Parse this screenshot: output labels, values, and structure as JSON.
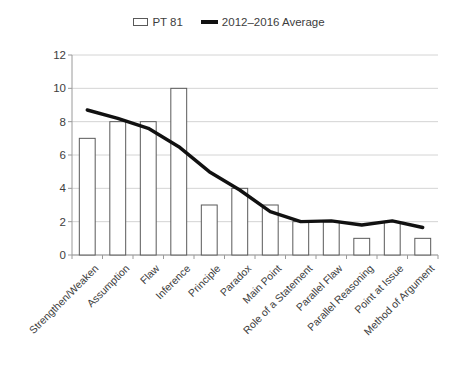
{
  "chart_data": {
    "type": "bar",
    "title": "",
    "xlabel": "",
    "ylabel": "",
    "ylim": [
      0,
      12
    ],
    "ytick_step": 2,
    "yticks": [
      0,
      2,
      4,
      6,
      8,
      10,
      12
    ],
    "grid": true,
    "legend_position": "top-center",
    "categories": [
      "Strengthen/Weaken",
      "Assumption",
      "Flaw",
      "Inference",
      "Principle",
      "Paradox",
      "Main Point",
      "Role of a Statement",
      "Parallel Flaw",
      "Parallel Reasoning",
      "Point at Issue",
      "Method of Argument"
    ],
    "series": [
      {
        "name": "PT 81",
        "type": "bar",
        "color": "#ffffff",
        "edge_color": "#595959",
        "values": [
          7,
          8,
          8,
          10,
          3,
          4,
          3,
          2,
          2,
          1,
          2,
          1
        ]
      },
      {
        "name": "2012–2016 Average",
        "type": "line",
        "color": "#111111",
        "values": [
          8.7,
          8.2,
          7.6,
          6.5,
          5.0,
          3.9,
          2.6,
          2.0,
          2.05,
          1.8,
          2.05,
          1.65
        ]
      }
    ]
  },
  "legend": {
    "entries": [
      {
        "label": "PT 81",
        "icon": "bar-swatch-icon"
      },
      {
        "label": "2012–2016 Average",
        "icon": "line-swatch-icon"
      }
    ]
  },
  "axes": {
    "y_tick_labels": [
      "12",
      "10",
      "8",
      "6",
      "4",
      "2",
      "0"
    ]
  }
}
